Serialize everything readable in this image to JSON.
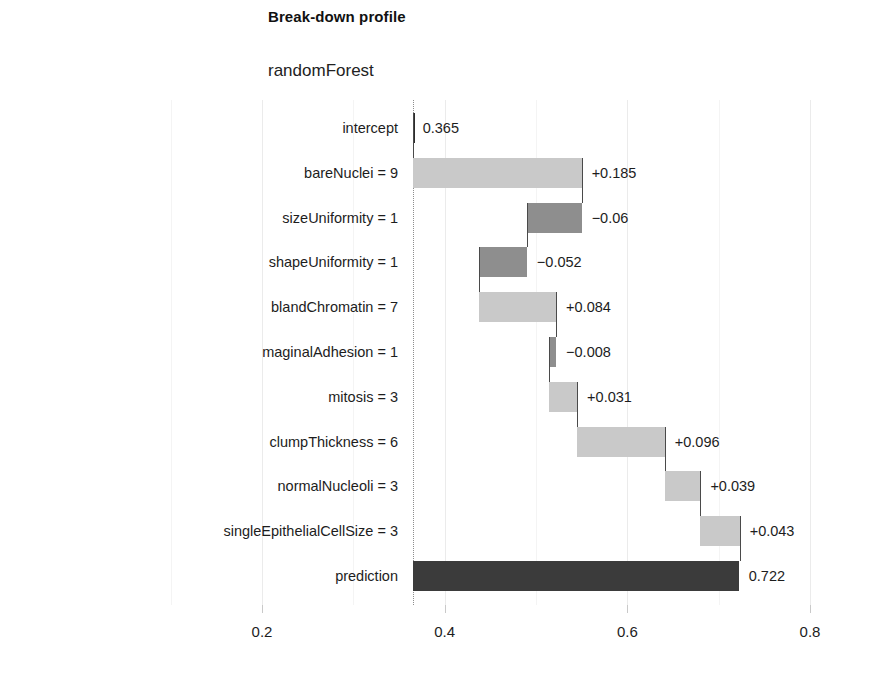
{
  "chart_data": {
    "type": "bar",
    "title": "Break-down profile",
    "subtitle": "randomForest",
    "xlabel": "",
    "ylabel": "",
    "xlim": [
      0.16,
      0.85
    ],
    "grid": true,
    "legend": "none",
    "x_ticks": [
      "0.2",
      "0.4",
      "0.6",
      "0.8"
    ],
    "x_tick_values": [
      0.2,
      0.4,
      0.6,
      0.8
    ],
    "categories": [
      "intercept",
      "bareNuclei = 9",
      "sizeUniformity = 1",
      "shapeUniformity = 1",
      "blandChromatin = 7",
      "maginalAdhesion = 1",
      "mitosis = 3",
      "clumpThickness = 6",
      "normalNucleoli = 3",
      "singleEpithelialCellSize = 3",
      "prediction"
    ],
    "values": [
      0.365,
      0.185,
      -0.06,
      -0.052,
      0.084,
      -0.008,
      0.031,
      0.096,
      0.039,
      0.043,
      0.722
    ],
    "value_labels": [
      "0.365",
      "+0.185",
      "−0.06",
      "−0.052",
      "+0.084",
      "−0.008",
      "+0.031",
      "+0.096",
      "+0.039",
      "+0.043",
      "0.722"
    ],
    "bar_starts": [
      0.365,
      0.365,
      0.55,
      0.49,
      0.438,
      0.522,
      0.514,
      0.545,
      0.641,
      0.68,
      0.365
    ],
    "bar_ends": [
      0.365,
      0.55,
      0.49,
      0.438,
      0.522,
      0.514,
      0.545,
      0.641,
      0.68,
      0.723,
      0.722
    ],
    "bar_kinds": [
      "intercept",
      "pos",
      "neg",
      "neg",
      "pos",
      "neg",
      "pos",
      "pos",
      "pos",
      "pos",
      "total"
    ],
    "colors": {
      "positive": "#c9c9c9",
      "negative": "#8e8e8e",
      "total": "#3b3b3b",
      "intercept_line": "#2c2c2c",
      "grid": "#ebebeb",
      "dotted_reference": "#8d8d8d"
    },
    "reference_line": 0.365
  }
}
